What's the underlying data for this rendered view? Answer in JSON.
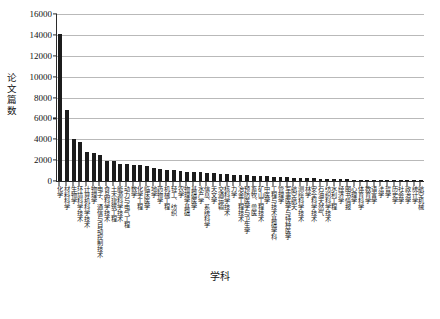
{
  "chart_data": {
    "type": "bar",
    "title": "",
    "xlabel": "学科",
    "ylabel": "论文篇数",
    "ylim": [
      0,
      16000
    ],
    "ytick_step": 2000,
    "yticks": [
      "0",
      "2000",
      "4000",
      "6000",
      "8000",
      "10000",
      "12000",
      "14000",
      "16000"
    ],
    "grid": true,
    "legend": "none",
    "bar_color": "#1c1c1c",
    "categories": [
      "化学",
      "材料科学",
      "生物学",
      "环境科学技术",
      "计算机科学技术",
      "物理学",
      "电子、通信与自动控制技术",
      "食品科学技术",
      "土木建筑工程",
      "能源科学技术",
      "动力与电气工程",
      "数学",
      "化学工程",
      "临床医学",
      "地学",
      "药物学",
      "机械工程",
      "轻工、纺织",
      "农学",
      "物理学基础",
      "基础医学",
      "水产学",
      "信息、系统科学",
      "天文学",
      "交通运输",
      "核科学技术",
      "力学",
      "冶金工程技术",
      "预防医学与卫生学",
      "畜牧、兽医",
      "矿山工程技术",
      "中医学",
      "工程与技术基础学科",
      "管理学",
      "军事医学与特种医学",
      "航空航天",
      "测绘科学技术",
      "林学",
      "安全科学技术",
      "石油天然气",
      "纺织科学技术",
      "水利工程",
      "经济学",
      "图书情报",
      "心理学",
      "体育科学",
      "教育学",
      "语言学",
      "法学",
      "哲学",
      "历史学",
      "社会学",
      "政治学",
      "统计学",
      "航空机械"
    ],
    "values": [
      14100,
      6850,
      3980,
      3720,
      2780,
      2700,
      2520,
      1900,
      1870,
      1660,
      1600,
      1560,
      1540,
      1480,
      1250,
      1120,
      1080,
      1010,
      940,
      900,
      860,
      820,
      790,
      760,
      700,
      660,
      620,
      580,
      540,
      500,
      470,
      440,
      410,
      380,
      350,
      320,
      300,
      280,
      260,
      240,
      220,
      200,
      180,
      160,
      145,
      130,
      115,
      100,
      90,
      80,
      70,
      60,
      50,
      40,
      30
    ]
  },
  "axes": {
    "y_title": "论文篇数",
    "x_title": "学科"
  },
  "caption": ""
}
